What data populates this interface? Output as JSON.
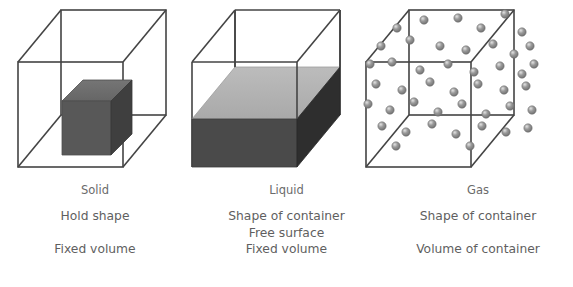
{
  "diagram": {
    "type": "states-of-matter-comparison",
    "columns": [
      {
        "key": "solid",
        "label": "Solid",
        "container_shape": "wireframe-cube",
        "content_description": "small dark shaded cube floating at the centre of the container",
        "properties": [
          "Hold shape",
          "",
          "Fixed volume"
        ]
      },
      {
        "key": "liquid",
        "label": "Liquid",
        "container_shape": "wireframe-cube",
        "content_description": "grey slab filling the lower portion of the container with a flat free surface",
        "properties": [
          "Shape of container",
          "Free surface",
          "Fixed volume"
        ]
      },
      {
        "key": "gas",
        "label": "Gas",
        "container_shape": "wireframe-cube",
        "content_description": "many small grey spheres scattered throughout the whole container",
        "properties": [
          "Shape of container",
          "",
          "Volume of container"
        ]
      }
    ]
  },
  "colors": {
    "wireframe_stroke": "#444444",
    "solid_block_top": "#6e6e6e",
    "solid_block_front": "#585858",
    "solid_block_side": "#3f3f3f",
    "liquid_surface": "#b3b3b3",
    "liquid_front": "#4a4a4a",
    "liquid_side": "#2e2e2e",
    "particle_fill": "#8c8c8c",
    "particle_highlight": "#d8d8d8",
    "text": "#5f5f5f",
    "background": "#ffffff"
  },
  "gas_particles": {
    "count": 45,
    "radius_px": 4.2,
    "points": [
      [
        35,
        22
      ],
      [
        62,
        14
      ],
      [
        96,
        12
      ],
      [
        119,
        22
      ],
      [
        143,
        8
      ],
      [
        160,
        26
      ],
      [
        19,
        40
      ],
      [
        48,
        34
      ],
      [
        78,
        40
      ],
      [
        104,
        44
      ],
      [
        131,
        38
      ],
      [
        152,
        48
      ],
      [
        168,
        40
      ],
      [
        8,
        58
      ],
      [
        30,
        56
      ],
      [
        58,
        64
      ],
      [
        86,
        58
      ],
      [
        112,
        66
      ],
      [
        138,
        60
      ],
      [
        160,
        68
      ],
      [
        172,
        58
      ],
      [
        14,
        78
      ],
      [
        40,
        84
      ],
      [
        68,
        76
      ],
      [
        92,
        86
      ],
      [
        116,
        78
      ],
      [
        142,
        84
      ],
      [
        164,
        80
      ],
      [
        6,
        98
      ],
      [
        28,
        104
      ],
      [
        52,
        96
      ],
      [
        76,
        106
      ],
      [
        100,
        98
      ],
      [
        124,
        108
      ],
      [
        148,
        100
      ],
      [
        170,
        104
      ],
      [
        20,
        120
      ],
      [
        44,
        126
      ],
      [
        70,
        118
      ],
      [
        94,
        128
      ],
      [
        120,
        120
      ],
      [
        144,
        126
      ],
      [
        166,
        122
      ],
      [
        34,
        140
      ],
      [
        108,
        140
      ]
    ]
  }
}
